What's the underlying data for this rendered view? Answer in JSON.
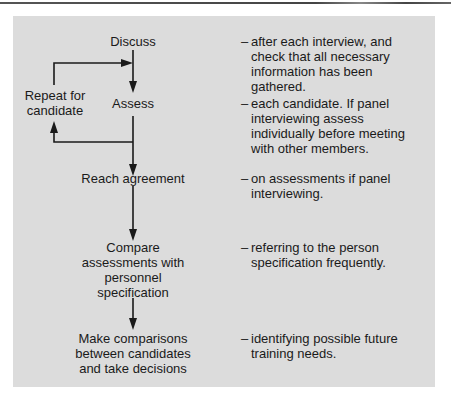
{
  "diagram": {
    "steps": [
      {
        "label": "Discuss",
        "note": "after each interview, and check that all necessary information has been gathered."
      },
      {
        "label": "Assess",
        "note": "each candidate. If panel interviewing assess individually before meeting with other members."
      },
      {
        "label": "Reach agreement",
        "note": "on assessments if panel interviewing."
      },
      {
        "label": "Compare assessments with personnel specification",
        "note": "referring to the person specification frequently."
      },
      {
        "label": "Make comparisons between candidates and take decisions",
        "note": "identifying possible future training needs."
      }
    ],
    "loop_label": "Repeat for candidate",
    "note_prefix": "–",
    "colors": {
      "panel_background": "#dcdcdc",
      "arrow": "#1a1a1a",
      "text": "#1a1a1a"
    }
  }
}
